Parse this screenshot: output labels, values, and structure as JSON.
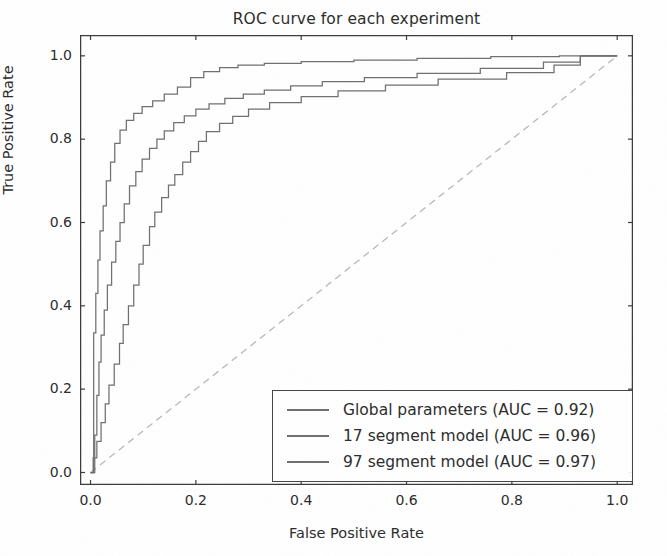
{
  "figure": {
    "background_color": "#ffffff",
    "axis_color": "#3a3a3a",
    "text_color": "#2b2b2b"
  },
  "chart_data": {
    "type": "line",
    "title": "ROC curve for each experiment",
    "xlabel": "False Positive Rate",
    "ylabel": "True Positive Rate",
    "xlim": [
      -0.02,
      1.03
    ],
    "ylim": [
      -0.03,
      1.05
    ],
    "xticks": [
      "0.0",
      "0.2",
      "0.4",
      "0.6",
      "0.8",
      "1.0"
    ],
    "xtick_values": [
      0.0,
      0.2,
      0.4,
      0.6,
      0.8,
      1.0
    ],
    "yticks": [
      "0.0",
      "0.2",
      "0.4",
      "0.6",
      "0.8",
      "1.0"
    ],
    "ytick_values": [
      0.0,
      0.2,
      0.4,
      0.6,
      0.8,
      1.0
    ],
    "grid": false,
    "legend_position": "lower right",
    "drawstyle": "steps-post",
    "reference_line": {
      "name": "chance-diagonal",
      "x": [
        0.0,
        1.0
      ],
      "y": [
        0.0,
        1.0
      ],
      "style": "dashed",
      "color": "#b9b9b9"
    },
    "series": [
      {
        "name": "Global parameters",
        "auc": 0.92,
        "label": "Global parameters (AUC = 0.92)",
        "color": "#6f6f6f",
        "x": [
          0.0,
          0.005,
          0.005,
          0.012,
          0.012,
          0.02,
          0.02,
          0.028,
          0.028,
          0.035,
          0.035,
          0.045,
          0.045,
          0.055,
          0.055,
          0.062,
          0.062,
          0.072,
          0.072,
          0.082,
          0.082,
          0.092,
          0.092,
          0.1,
          0.1,
          0.112,
          0.112,
          0.122,
          0.122,
          0.135,
          0.135,
          0.148,
          0.148,
          0.16,
          0.16,
          0.175,
          0.175,
          0.19,
          0.19,
          0.205,
          0.205,
          0.22,
          0.22,
          0.245,
          0.245,
          0.27,
          0.27,
          0.3,
          0.3,
          0.34,
          0.34,
          0.4,
          0.4,
          0.47,
          0.47,
          0.56,
          0.56,
          0.66,
          0.66,
          0.79,
          0.79,
          0.88,
          0.88,
          0.93,
          0.93,
          1.0
        ],
        "y": [
          0.0,
          0.0,
          0.035,
          0.035,
          0.075,
          0.075,
          0.12,
          0.12,
          0.165,
          0.165,
          0.21,
          0.21,
          0.26,
          0.26,
          0.31,
          0.31,
          0.355,
          0.355,
          0.4,
          0.4,
          0.45,
          0.45,
          0.5,
          0.5,
          0.545,
          0.545,
          0.59,
          0.59,
          0.625,
          0.625,
          0.66,
          0.66,
          0.69,
          0.69,
          0.715,
          0.715,
          0.745,
          0.745,
          0.77,
          0.77,
          0.795,
          0.795,
          0.818,
          0.818,
          0.838,
          0.838,
          0.855,
          0.855,
          0.872,
          0.872,
          0.888,
          0.888,
          0.902,
          0.902,
          0.916,
          0.916,
          0.93,
          0.93,
          0.944,
          0.944,
          0.96,
          0.96,
          0.978,
          0.978,
          1.0,
          1.0
        ]
      },
      {
        "name": "17 segment model",
        "auc": 0.96,
        "label": "17 segment model (AUC = 0.96)",
        "color": "#6f6f6f",
        "x": [
          0.0,
          0.008,
          0.008,
          0.012,
          0.012,
          0.016,
          0.016,
          0.02,
          0.02,
          0.026,
          0.026,
          0.032,
          0.032,
          0.04,
          0.04,
          0.048,
          0.048,
          0.056,
          0.056,
          0.064,
          0.064,
          0.074,
          0.074,
          0.086,
          0.086,
          0.098,
          0.098,
          0.112,
          0.112,
          0.126,
          0.126,
          0.14,
          0.14,
          0.158,
          0.158,
          0.178,
          0.178,
          0.2,
          0.2,
          0.225,
          0.225,
          0.255,
          0.255,
          0.29,
          0.29,
          0.33,
          0.33,
          0.38,
          0.38,
          0.44,
          0.44,
          0.52,
          0.52,
          0.62,
          0.62,
          0.74,
          0.74,
          0.86,
          0.86,
          0.93,
          0.93,
          1.0
        ],
        "y": [
          0.0,
          0.0,
          0.09,
          0.09,
          0.185,
          0.185,
          0.265,
          0.265,
          0.33,
          0.33,
          0.39,
          0.39,
          0.45,
          0.45,
          0.505,
          0.505,
          0.555,
          0.555,
          0.6,
          0.6,
          0.645,
          0.645,
          0.688,
          0.688,
          0.722,
          0.722,
          0.752,
          0.752,
          0.778,
          0.778,
          0.8,
          0.8,
          0.82,
          0.82,
          0.84,
          0.84,
          0.856,
          0.856,
          0.872,
          0.872,
          0.885,
          0.885,
          0.898,
          0.898,
          0.908,
          0.908,
          0.918,
          0.918,
          0.928,
          0.928,
          0.938,
          0.938,
          0.948,
          0.948,
          0.958,
          0.958,
          0.97,
          0.97,
          0.985,
          0.985,
          1.0,
          1.0
        ]
      },
      {
        "name": "97 segment model",
        "auc": 0.97,
        "label": "97 segment model (AUC = 0.97)",
        "color": "#6f6f6f",
        "x": [
          0.0,
          0.006,
          0.006,
          0.01,
          0.01,
          0.014,
          0.014,
          0.018,
          0.018,
          0.024,
          0.024,
          0.03,
          0.03,
          0.038,
          0.038,
          0.046,
          0.046,
          0.056,
          0.056,
          0.068,
          0.068,
          0.082,
          0.082,
          0.098,
          0.098,
          0.118,
          0.118,
          0.14,
          0.14,
          0.165,
          0.165,
          0.19,
          0.19,
          0.215,
          0.215,
          0.245,
          0.245,
          0.28,
          0.28,
          0.33,
          0.33,
          0.4,
          0.4,
          0.5,
          0.5,
          0.62,
          0.62,
          0.76,
          0.76,
          0.89,
          0.89,
          1.0
        ],
        "y": [
          0.0,
          0.0,
          0.335,
          0.335,
          0.43,
          0.43,
          0.51,
          0.51,
          0.58,
          0.58,
          0.64,
          0.64,
          0.7,
          0.7,
          0.745,
          0.745,
          0.79,
          0.79,
          0.822,
          0.822,
          0.845,
          0.845,
          0.862,
          0.862,
          0.878,
          0.878,
          0.892,
          0.892,
          0.908,
          0.908,
          0.925,
          0.925,
          0.948,
          0.948,
          0.962,
          0.962,
          0.972,
          0.972,
          0.978,
          0.978,
          0.982,
          0.982,
          0.986,
          0.986,
          0.99,
          0.99,
          0.994,
          0.994,
          0.998,
          0.998,
          1.0,
          1.0
        ]
      }
    ]
  }
}
